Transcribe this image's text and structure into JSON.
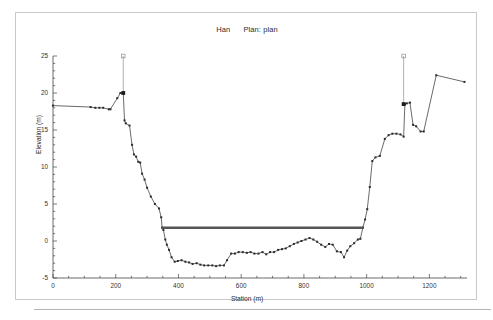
{
  "window": {
    "background": "#ffffff",
    "frame_border_color": "#c9c9c9"
  },
  "chart_data": {
    "type": "line",
    "title": "Han      Plan: plan",
    "plan_label": "Plan: plan",
    "river_label": "Han",
    "xlabel": "Station (m)",
    "ylabel": "Elevation (m)",
    "xlim": [
      0,
      1320
    ],
    "ylim": [
      -5,
      25
    ],
    "xticks": [
      0,
      200,
      400,
      600,
      800,
      1000,
      1200
    ],
    "yticks": [
      -5,
      0,
      5,
      10,
      15,
      20,
      25
    ],
    "xtick_labels": [
      "0",
      "200",
      "400",
      "600",
      "800",
      "1000",
      "1200"
    ],
    "ytick_labels": [
      "-5",
      "0",
      "5",
      "10",
      "15",
      "20",
      "25"
    ],
    "x_minor_tick_step": 50,
    "y_minor_tick_step": 1,
    "grid": false,
    "legend_position": "none",
    "series": [
      {
        "name": "Ground",
        "color": "#2b2b2b",
        "marker": "square",
        "marker_size": 2.0,
        "x": [
          0,
          120,
          135,
          148,
          160,
          178,
          183,
          205,
          215,
          224,
          228,
          232,
          244,
          252,
          258,
          265,
          272,
          278,
          284,
          292,
          300,
          312,
          325,
          338,
          345,
          348,
          352,
          358,
          363,
          370,
          378,
          388,
          398,
          410,
          422,
          434,
          445,
          458,
          470,
          482,
          495,
          508,
          520,
          532,
          545,
          555,
          568,
          580,
          592,
          605,
          618,
          630,
          642,
          655,
          668,
          680,
          692,
          705,
          718,
          730,
          742,
          755,
          768,
          780,
          792,
          805,
          818,
          830,
          842,
          855,
          868,
          880,
          892,
          905,
          918,
          928,
          938,
          948,
          960,
          972,
          980,
          988,
          995,
          1002,
          1010,
          1018,
          1028,
          1042,
          1058,
          1070,
          1082,
          1095,
          1108,
          1118,
          1122,
          1128,
          1138,
          1148,
          1158,
          1172,
          1182,
          1222,
          1312
        ],
        "y": [
          18.3,
          18.1,
          18.0,
          18.0,
          18.0,
          17.8,
          17.8,
          19.3,
          20.0,
          20.0,
          16.3,
          15.9,
          15.6,
          13.0,
          11.7,
          11.4,
          10.7,
          10.6,
          9.1,
          8.3,
          7.2,
          6.0,
          5.0,
          4.4,
          3.2,
          1.8,
          1.5,
          0.2,
          -0.5,
          -1.2,
          -2.2,
          -2.8,
          -2.7,
          -2.6,
          -2.8,
          -2.9,
          -3.1,
          -3.0,
          -3.2,
          -3.3,
          -3.3,
          -3.3,
          -3.4,
          -3.3,
          -3.3,
          -2.6,
          -1.7,
          -1.7,
          -1.5,
          -1.5,
          -1.6,
          -1.5,
          -1.7,
          -1.7,
          -1.5,
          -1.8,
          -1.5,
          -1.5,
          -1.2,
          -1.1,
          -1.0,
          -0.7,
          -0.4,
          -0.2,
          0.0,
          0.2,
          0.4,
          0.2,
          -0.1,
          -0.5,
          -0.8,
          -0.4,
          -0.5,
          -1.4,
          -1.5,
          -2.2,
          -1.3,
          -0.7,
          -0.3,
          0.2,
          0.3,
          1.8,
          2.9,
          4.3,
          7.3,
          10.8,
          11.3,
          11.5,
          13.8,
          14.3,
          14.5,
          14.5,
          14.4,
          14.1,
          18.5,
          18.6,
          18.7,
          15.7,
          15.5,
          14.8,
          14.8,
          22.4,
          21.5
        ]
      },
      {
        "name": "WS plan",
        "color": "#555555",
        "type": "water-surface",
        "x_start": 345,
        "x_end": 990,
        "elevation": 1.8,
        "line_width": 2.6
      }
    ],
    "bank_stations": [
      {
        "name": "left-bank-station",
        "x": 224,
        "elevation": 20.0,
        "top": 25.0
      },
      {
        "name": "right-bank-station",
        "x": 1118,
        "elevation": 18.5,
        "top": 25.0
      }
    ]
  }
}
